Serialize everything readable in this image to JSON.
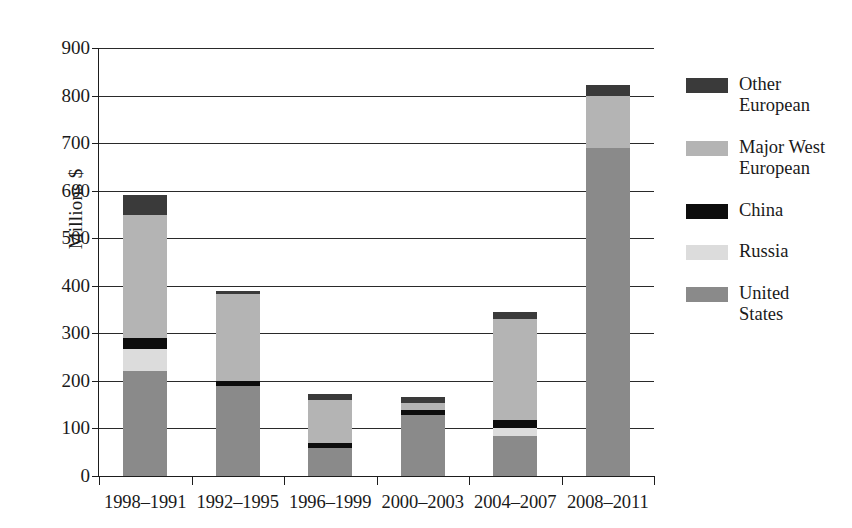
{
  "chart_data": {
    "type": "bar",
    "subtype": "stacked-vertical",
    "title": "",
    "xlabel": "",
    "ylabel": "Millions $",
    "ylim": [
      0,
      900
    ],
    "ytick_step": 100,
    "yticks": [
      "900",
      "800",
      "700",
      "600",
      "500",
      "400",
      "300",
      "200",
      "100",
      "0"
    ],
    "ytick_values": [
      900,
      800,
      700,
      600,
      500,
      400,
      300,
      200,
      100,
      0
    ],
    "grid": "horizontal",
    "legend_position": "right",
    "categories": [
      "1998–1991",
      "1992–1995",
      "1996–1999",
      "2000–2003",
      "2004–2007",
      "2008–2011"
    ],
    "series": [
      {
        "name": "United States",
        "color": "#8a8a8a",
        "values": [
          220,
          190,
          58,
          128,
          85,
          690
        ]
      },
      {
        "name": "Russia",
        "color": "#dcdcdc",
        "values": [
          48,
          0,
          0,
          0,
          15,
          0
        ]
      },
      {
        "name": "China",
        "color": "#0d0d0d",
        "values": [
          22,
          10,
          12,
          10,
          18,
          0
        ]
      },
      {
        "name": "Major West European",
        "color": "#b4b4b4",
        "values": [
          258,
          182,
          90,
          16,
          212,
          110
        ]
      },
      {
        "name": "Other European",
        "color": "#3a3a3a",
        "values": [
          42,
          8,
          12,
          12,
          15,
          22
        ]
      }
    ],
    "totals": [
      590,
      390,
      172,
      166,
      345,
      822
    ]
  },
  "legend": {
    "items": [
      {
        "label": "Other\nEuropean",
        "color": "#3a3a3a"
      },
      {
        "label": "Major West\nEuropean",
        "color": "#b4b4b4"
      },
      {
        "label": "China",
        "color": "#0d0d0d"
      },
      {
        "label": "Russia",
        "color": "#dcdcdc"
      },
      {
        "label": "United\nStates",
        "color": "#8a8a8a"
      }
    ]
  },
  "axes": {
    "y_title": "Millions $"
  }
}
